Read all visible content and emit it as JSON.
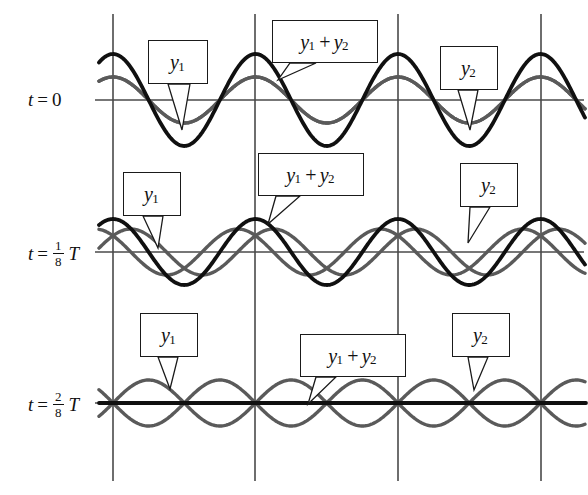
{
  "figure": {
    "background_color": "#ffffff",
    "grid_color": "#4a4a4a",
    "wave_color_component": "#5a5a5a",
    "wave_color_sum": "#101010",
    "width": 588,
    "height": 495
  },
  "rows": [
    {
      "id": "row-t0",
      "time_label": {
        "var": "t",
        "eq": "=",
        "value": "0",
        "has_fraction": false,
        "numerator": "",
        "denominator": "",
        "unit": ""
      },
      "baseline_y": 100,
      "label_left": "y",
      "label_left_sub": "1",
      "label_mid_a": "y",
      "label_mid_a_sub": "1",
      "label_mid_op": "+",
      "label_mid_b": "y",
      "label_mid_b_sub": "2",
      "label_right": "y",
      "label_right_sub": "2",
      "phase_deg": 0,
      "sum_amplitude": 46,
      "component_amplitude": 23
    },
    {
      "id": "row-t1-8",
      "time_label": {
        "var": "t",
        "eq": "=",
        "value": "",
        "has_fraction": true,
        "numerator": "1",
        "denominator": "8",
        "unit": "T"
      },
      "baseline_y": 252,
      "label_left": "y",
      "label_left_sub": "1",
      "label_mid_a": "y",
      "label_mid_a_sub": "1",
      "label_mid_op": "+",
      "label_mid_b": "y",
      "label_mid_b_sub": "2",
      "label_right": "y",
      "label_right_sub": "2",
      "phase_deg": 45,
      "sum_amplitude": 33,
      "component_amplitude": 23
    },
    {
      "id": "row-t2-8",
      "time_label": {
        "var": "t",
        "eq": "=",
        "value": "",
        "has_fraction": true,
        "numerator": "2",
        "denominator": "8",
        "unit": "T"
      },
      "baseline_y": 403,
      "label_left": "y",
      "label_left_sub": "1",
      "label_mid_a": "y",
      "label_mid_a_sub": "1",
      "label_mid_op": "+",
      "label_mid_b": "y",
      "label_mid_b_sub": "2",
      "label_right": "y",
      "label_right_sub": "2",
      "phase_deg": 90,
      "sum_amplitude": 0,
      "component_amplitude": 23
    }
  ],
  "chart_data": {
    "type": "line",
    "xlabel": "",
    "ylabel": "",
    "grid": true,
    "legend_position": "inline-callouts",
    "x_range": [
      113,
      588
    ],
    "vertical_gridlines_x": [
      113,
      255,
      398,
      541
    ],
    "wavelength_px": 142.5,
    "component_amplitude_px": 23,
    "panels": [
      {
        "time": "t = 0",
        "phase_deg": 0,
        "series": [
          {
            "name": "y1",
            "color": "#5a5a5a",
            "amplitude": 23,
            "direction": "right",
            "description": "cosine wave, amplitude A"
          },
          {
            "name": "y2",
            "color": "#5a5a5a",
            "amplitude": 23,
            "direction": "left",
            "description": "cosine wave, amplitude A, exactly in phase with y1"
          },
          {
            "name": "y1 + y2",
            "color": "#101010",
            "amplitude": 46,
            "description": "sum, amplitude 2A (maximum constructive interference)"
          }
        ]
      },
      {
        "time": "t = 1/8 T",
        "phase_deg": 45,
        "series": [
          {
            "name": "y1",
            "color": "#5a5a5a",
            "amplitude": 23,
            "direction": "right",
            "description": "shifted right by lambda/8"
          },
          {
            "name": "y2",
            "color": "#5a5a5a",
            "amplitude": 23,
            "direction": "left",
            "description": "shifted left by lambda/8"
          },
          {
            "name": "y1 + y2",
            "color": "#101010",
            "amplitude": 33,
            "description": "sum, amplitude 2A cos(45 deg) = 1.41A"
          }
        ]
      },
      {
        "time": "t = 2/8 T",
        "phase_deg": 90,
        "series": [
          {
            "name": "y1",
            "color": "#5a5a5a",
            "amplitude": 23,
            "direction": "right",
            "description": "shifted right by lambda/4"
          },
          {
            "name": "y2",
            "color": "#5a5a5a",
            "amplitude": 23,
            "direction": "left",
            "description": "shifted left by lambda/4, exactly out of phase with y1"
          },
          {
            "name": "y1 + y2",
            "color": "#101010",
            "amplitude": 0,
            "description": "sum is zero everywhere (complete destructive interference)"
          }
        ]
      }
    ]
  }
}
